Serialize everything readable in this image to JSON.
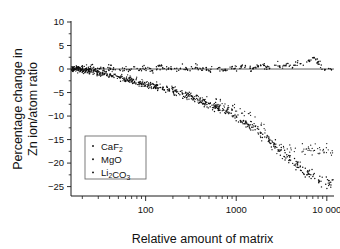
{
  "chart_data": {
    "type": "scatter",
    "title": "",
    "xlabel": "Relative amount of matrix",
    "ylabel": "Percentage change in Zn ion/atom ratio",
    "ylabel_line1": "Percentage change in",
    "ylabel_line2": "Zn ion/atom ratio",
    "xscale": "log",
    "yscale": "linear",
    "xlim": [
      15,
      12000
    ],
    "ylim": [
      -27,
      10
    ],
    "grid": false,
    "legend_position": "lower-left-inside",
    "xticks": [
      100,
      1000,
      10000
    ],
    "xticklabels": [
      "100",
      "1000",
      "10 000"
    ],
    "yticks": [
      10,
      5,
      0,
      -5,
      -10,
      -15,
      -20,
      -25
    ],
    "yticklabels": [
      "10",
      "5",
      "0",
      "−5",
      "−10",
      "−15",
      "−20",
      "−25"
    ],
    "marker": "point",
    "marker_color": "#0d0d0d",
    "series": [
      {
        "name": "CaF2",
        "label": "CaF₂",
        "label_base": "CaF",
        "label_sub": "2",
        "n_points": 320,
        "description": "Essentially flat near zero across the whole range with small scatter; a slight rise to about +1 to +3 above a relative amount of 3000.",
        "model": "flat",
        "points": [
          [
            18,
            0.1
          ],
          [
            19,
            -0.3
          ],
          [
            20,
            0.4
          ],
          [
            21,
            -0.1
          ],
          [
            22,
            0.6
          ],
          [
            23,
            0.0
          ],
          [
            24,
            -0.5
          ],
          [
            25,
            0.3
          ],
          [
            26,
            0.8
          ],
          [
            27,
            -0.2
          ],
          [
            28,
            0.1
          ],
          [
            30,
            -0.4
          ],
          [
            32,
            0.5
          ],
          [
            34,
            0.2
          ],
          [
            36,
            -0.6
          ],
          [
            38,
            0.3
          ],
          [
            40,
            0.0
          ],
          [
            43,
            0.7
          ],
          [
            46,
            -0.3
          ],
          [
            50,
            0.2
          ],
          [
            55,
            -0.1
          ],
          [
            60,
            0.4
          ],
          [
            65,
            -0.5
          ],
          [
            70,
            0.1
          ],
          [
            78,
            0.3
          ],
          [
            86,
            -0.2
          ],
          [
            95,
            0.5
          ],
          [
            105,
            0.0
          ],
          [
            118,
            -0.4
          ],
          [
            130,
            0.2
          ],
          [
            145,
            0.6
          ],
          [
            160,
            -0.1
          ],
          [
            180,
            0.3
          ],
          [
            200,
            0.0
          ],
          [
            225,
            -0.3
          ],
          [
            250,
            0.4
          ],
          [
            280,
            0.1
          ],
          [
            320,
            -0.2
          ],
          [
            360,
            0.5
          ],
          [
            410,
            0.0
          ],
          [
            460,
            0.2
          ],
          [
            520,
            -0.4
          ],
          [
            600,
            0.3
          ],
          [
            680,
            0.1
          ],
          [
            780,
            -0.2
          ],
          [
            880,
            0.4
          ],
          [
            1000,
            0.0
          ],
          [
            1150,
            0.6
          ],
          [
            1300,
            0.2
          ],
          [
            1500,
            -0.1
          ],
          [
            1700,
            0.5
          ],
          [
            2000,
            0.8
          ],
          [
            2300,
            0.3
          ],
          [
            2700,
            1.0
          ],
          [
            3100,
            0.4
          ],
          [
            3600,
            1.2
          ],
          [
            4200,
            0.6
          ],
          [
            4800,
            1.5
          ],
          [
            5600,
            0.9
          ],
          [
            6500,
            2.0
          ],
          [
            7200,
            2.6
          ],
          [
            8000,
            1.2
          ],
          [
            9000,
            0.3
          ],
          [
            10000,
            0.1
          ]
        ]
      },
      {
        "name": "MgO",
        "label": "MgO",
        "label_base": "MgO",
        "label_sub": "",
        "n_points": 260,
        "description": "Declines slowly from 0, reaching about −3 near 100, −7 near 700, −10 near 1500, then drops steeply to about −16 by 2500 and merges with the lower band.",
        "model": "upper-decline",
        "points": [
          [
            20,
            -0.2
          ],
          [
            25,
            -0.4
          ],
          [
            30,
            -0.7
          ],
          [
            38,
            -1.0
          ],
          [
            48,
            -1.4
          ],
          [
            60,
            -1.9
          ],
          [
            75,
            -2.4
          ],
          [
            90,
            -2.9
          ],
          [
            110,
            -3.3
          ],
          [
            135,
            -3.7
          ],
          [
            165,
            -4.2
          ],
          [
            200,
            -4.7
          ],
          [
            250,
            -5.2
          ],
          [
            310,
            -5.8
          ],
          [
            380,
            -6.3
          ],
          [
            470,
            -6.9
          ],
          [
            580,
            -7.3
          ],
          [
            700,
            -7.8
          ],
          [
            860,
            -8.4
          ],
          [
            1050,
            -9.0
          ],
          [
            1300,
            -9.6
          ],
          [
            1600,
            -10.4
          ],
          [
            1850,
            -11.6
          ],
          [
            2100,
            -13.2
          ],
          [
            2350,
            -15.0
          ],
          [
            2600,
            -16.3
          ],
          [
            2900,
            -17.2
          ]
        ]
      },
      {
        "name": "Li2CO3",
        "label": "Li₂CO₃",
        "label_base": "Li",
        "label_sub": "2",
        "label_base2": "CO",
        "label_sub2": "3",
        "n_points": 520,
        "description": "Dense band dropping from 0 to about −4 near 150, −6 near 300, −10 near 900, −15 near 2000, −20 near 5000 and about −24 at 8000–10000.",
        "model": "lower-decline",
        "points": [
          [
            18,
            -0.1
          ],
          [
            22,
            -0.3
          ],
          [
            28,
            -0.6
          ],
          [
            35,
            -1.0
          ],
          [
            45,
            -1.5
          ],
          [
            58,
            -2.1
          ],
          [
            72,
            -2.7
          ],
          [
            90,
            -3.2
          ],
          [
            110,
            -3.6
          ],
          [
            135,
            -3.9
          ],
          [
            165,
            -4.2
          ],
          [
            200,
            -4.6
          ],
          [
            245,
            -5.1
          ],
          [
            300,
            -5.7
          ],
          [
            370,
            -6.4
          ],
          [
            450,
            -7.1
          ],
          [
            550,
            -7.9
          ],
          [
            680,
            -8.7
          ],
          [
            830,
            -9.5
          ],
          [
            1000,
            -10.3
          ],
          [
            1250,
            -11.4
          ],
          [
            1500,
            -12.4
          ],
          [
            1800,
            -13.6
          ],
          [
            2200,
            -15.0
          ],
          [
            2700,
            -16.6
          ],
          [
            3200,
            -17.9
          ],
          [
            3900,
            -19.2
          ],
          [
            4700,
            -20.4
          ],
          [
            5600,
            -21.5
          ],
          [
            6600,
            -22.5
          ],
          [
            7600,
            -23.4
          ],
          [
            8600,
            -23.9
          ],
          [
            9600,
            -24.2
          ]
        ]
      }
    ]
  },
  "legend": {
    "items": [
      {
        "marker": "dot",
        "label": "CaF₂"
      },
      {
        "marker": "dot",
        "label": "MgO"
      },
      {
        "marker": "dot",
        "label": "Li₂CO₃"
      }
    ]
  }
}
